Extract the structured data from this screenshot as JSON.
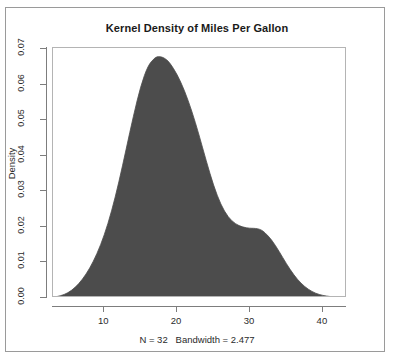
{
  "chart_data": {
    "type": "area",
    "title": "Kernel Density of Miles Per Gallon",
    "subtitle": "N = 32   Bandwidth = 2.477",
    "xlabel": "",
    "ylabel": "Density",
    "xlim": [
      2.967,
      43.033
    ],
    "ylim": [
      0.0,
      0.07
    ],
    "grid": false,
    "legend": null,
    "fill_color": "#4c4c4c",
    "line_color": "#4c4c4c",
    "x_ticks": [
      10,
      20,
      30,
      40
    ],
    "x_tick_labels": [
      "10",
      "20",
      "30",
      "40"
    ],
    "y_ticks": [
      0.0,
      0.01,
      0.02,
      0.03,
      0.04,
      0.05,
      0.06,
      0.07
    ],
    "y_tick_labels": [
      "0.00",
      "0.01",
      "0.02",
      "0.03",
      "0.04",
      "0.05",
      "0.06",
      "0.07"
    ],
    "n": 32,
    "bandwidth": 2.477,
    "series": [
      {
        "name": "Density of mpg",
        "x": [
          2.967,
          4.0,
          5.0,
          6.0,
          7.0,
          8.0,
          9.0,
          10.0,
          11.0,
          12.0,
          13.0,
          14.0,
          15.0,
          16.0,
          17.0,
          17.5,
          18.0,
          18.5,
          19.0,
          20.0,
          21.0,
          22.0,
          23.0,
          24.0,
          25.0,
          26.0,
          27.0,
          28.0,
          29.0,
          30.0,
          30.5,
          31.0,
          31.5,
          32.0,
          33.0,
          34.0,
          35.0,
          36.0,
          37.0,
          38.0,
          39.0,
          40.0,
          41.0,
          42.0,
          43.033
        ],
        "y": [
          0.0002,
          0.0006,
          0.0014,
          0.0029,
          0.0052,
          0.0083,
          0.0124,
          0.0176,
          0.0243,
          0.0325,
          0.0418,
          0.0512,
          0.0596,
          0.0654,
          0.0677,
          0.0679,
          0.0677,
          0.0671,
          0.0661,
          0.0629,
          0.0584,
          0.0527,
          0.0459,
          0.0385,
          0.0316,
          0.0262,
          0.0227,
          0.0208,
          0.0199,
          0.0196,
          0.0196,
          0.0195,
          0.0192,
          0.0185,
          0.0163,
          0.0131,
          0.0096,
          0.0065,
          0.0041,
          0.0024,
          0.0013,
          0.0007,
          0.0004,
          0.0002,
          0.0001
        ]
      }
    ],
    "annotations": {
      "primary_mode_x": 17.5,
      "primary_mode_y": 0.0679,
      "secondary_shoulder_x": 30.5,
      "secondary_shoulder_y": 0.0196
    }
  }
}
